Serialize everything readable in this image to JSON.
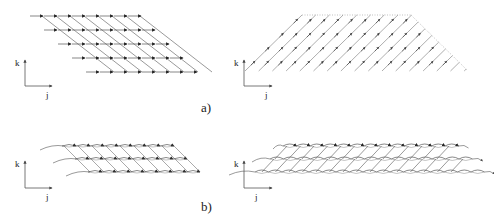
{
  "figure": {
    "labels": {
      "a": "a)",
      "b": "b)"
    },
    "axes": {
      "vertical_label": "k",
      "horizontal_label": "j"
    },
    "colors": {
      "stroke": "#555555",
      "arrowhead": "#222222",
      "boundary_dotted": "#999999"
    },
    "panels": [
      {
        "id": "a-left",
        "row_label": "a)",
        "description": "sheared rectangular grid of rightward-pointing arrows with down-right diagonal connectors",
        "rows": 5,
        "cols": 8,
        "origin": [
          30,
          16
        ],
        "col_spacing": 14,
        "row_spacing": 14,
        "row_shift": 14,
        "arrow_direction": "right"
      },
      {
        "id": "a-right",
        "row_label": "a)",
        "description": "trapezoidal field of diagonal up-right arrows",
        "top_edge": [
          302,
          411
        ],
        "bottom_edge": [
          245,
          468
        ],
        "top_y": 15,
        "bottom_y": 71,
        "rows": 4,
        "line_count": 15,
        "arrow_direction": "up-right"
      },
      {
        "id": "b-left",
        "row_label": "b)",
        "description": "three stacked rows of curved strands with arrowheads on a sheared grid",
        "rows": 3,
        "cols": 8,
        "origin": [
          62,
          146
        ],
        "col_spacing": 14,
        "row_spacing": 13,
        "row_shift": 13
      },
      {
        "id": "b-right",
        "row_label": "b)",
        "description": "three stacked rows of interleaved wavy strands with diagonal links",
        "rows": 3,
        "cols": 13,
        "origin": [
          285,
          146
        ],
        "col_spacing": 13.5,
        "row_spacing": 13
      }
    ]
  }
}
